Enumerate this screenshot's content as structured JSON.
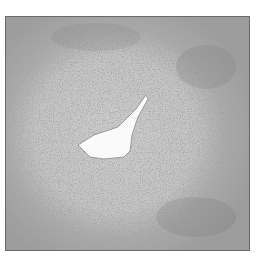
{
  "image": {
    "description": "Grayscale histology micrograph of a tissue cross-section with a central irregular white lumen",
    "colors": {
      "background": "#ffffff",
      "tissue_base": "#b9b9b9",
      "tissue_light": "#cfcfcf",
      "tissue_dark": "#6e6e6e",
      "lumen": "#fafafa",
      "frame_border": "#6a6a6a"
    }
  }
}
